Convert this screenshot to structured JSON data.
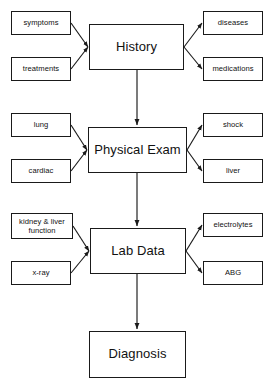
{
  "diagram": {
    "background_color": "#ffffff",
    "stroke_color": "#1a1a1a",
    "main_nodes": [
      {
        "id": "history",
        "label": "History",
        "x": 89,
        "y": 24,
        "w": 95,
        "h": 46
      },
      {
        "id": "physical_exam",
        "label": "Physical Exam",
        "x": 88,
        "y": 127,
        "w": 99,
        "h": 46
      },
      {
        "id": "lab_data",
        "label": "Lab Data",
        "x": 90,
        "y": 228,
        "w": 96,
        "h": 46
      },
      {
        "id": "diagnosis",
        "label": "Diagnosis",
        "x": 89,
        "y": 331,
        "w": 97,
        "h": 47
      }
    ],
    "leaf_nodes": [
      {
        "id": "symptoms",
        "label": "symptoms",
        "x": 11,
        "y": 11,
        "w": 60,
        "h": 24,
        "lines": 1
      },
      {
        "id": "treatments",
        "label": "treatments",
        "x": 11,
        "y": 57,
        "w": 60,
        "h": 24,
        "lines": 1
      },
      {
        "id": "diseases",
        "label": "diseases",
        "x": 203,
        "y": 11,
        "w": 60,
        "h": 24,
        "lines": 1
      },
      {
        "id": "medications",
        "label": "medications",
        "x": 203,
        "y": 57,
        "w": 60,
        "h": 24,
        "lines": 1
      },
      {
        "id": "lung",
        "label": "lung",
        "x": 11,
        "y": 113,
        "w": 60,
        "h": 24,
        "lines": 1
      },
      {
        "id": "cardiac",
        "label": "cardiac",
        "x": 11,
        "y": 159,
        "w": 60,
        "h": 24,
        "lines": 1
      },
      {
        "id": "shock",
        "label": "shock",
        "x": 203,
        "y": 113,
        "w": 60,
        "h": 24,
        "lines": 1
      },
      {
        "id": "liver",
        "label": "liver",
        "x": 203,
        "y": 159,
        "w": 60,
        "h": 24,
        "lines": 1
      },
      {
        "id": "kidney_liver_function",
        "label": "kidney & liver function",
        "x": 11,
        "y": 213,
        "w": 62,
        "h": 26,
        "lines": 2
      },
      {
        "id": "xray",
        "label": "x-ray",
        "x": 11,
        "y": 261,
        "w": 60,
        "h": 24,
        "lines": 1
      },
      {
        "id": "electrolytes",
        "label": "electrolytes",
        "x": 203,
        "y": 213,
        "w": 60,
        "h": 24,
        "lines": 1
      },
      {
        "id": "abg",
        "label": "ABG",
        "x": 203,
        "y": 261,
        "w": 60,
        "h": 24,
        "lines": 1
      }
    ],
    "edges": [
      {
        "from": "symptoms",
        "to": "history",
        "direction": "in"
      },
      {
        "from": "treatments",
        "to": "history",
        "direction": "in"
      },
      {
        "from": "history",
        "to": "diseases",
        "direction": "out"
      },
      {
        "from": "history",
        "to": "medications",
        "direction": "out"
      },
      {
        "from": "history",
        "to": "physical_exam",
        "direction": "down"
      },
      {
        "from": "lung",
        "to": "physical_exam",
        "direction": "in"
      },
      {
        "from": "cardiac",
        "to": "physical_exam",
        "direction": "in"
      },
      {
        "from": "physical_exam",
        "to": "shock",
        "direction": "out"
      },
      {
        "from": "physical_exam",
        "to": "liver",
        "direction": "out"
      },
      {
        "from": "physical_exam",
        "to": "lab_data",
        "direction": "down"
      },
      {
        "from": "kidney_liver_function",
        "to": "lab_data",
        "direction": "in"
      },
      {
        "from": "xray",
        "to": "lab_data",
        "direction": "in"
      },
      {
        "from": "lab_data",
        "to": "electrolytes",
        "direction": "out"
      },
      {
        "from": "lab_data",
        "to": "abg",
        "direction": "out"
      },
      {
        "from": "lab_data",
        "to": "diagnosis",
        "direction": "down"
      }
    ]
  }
}
